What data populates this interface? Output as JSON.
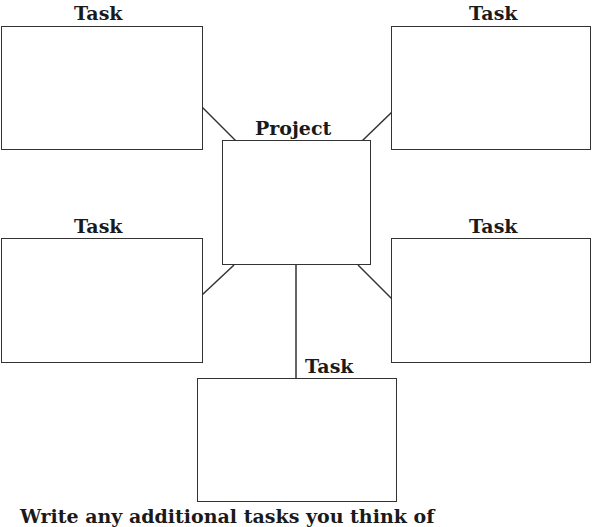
{
  "diagram": {
    "center": {
      "label": "Project"
    },
    "tasks": [
      {
        "label": "Task",
        "position": "top-left"
      },
      {
        "label": "Task",
        "position": "top-right"
      },
      {
        "label": "Task",
        "position": "middle-left"
      },
      {
        "label": "Task",
        "position": "middle-right"
      },
      {
        "label": "Task",
        "position": "bottom-center"
      }
    ],
    "footer_text": "Write any additional tasks you think of",
    "line_color": "#333333"
  }
}
